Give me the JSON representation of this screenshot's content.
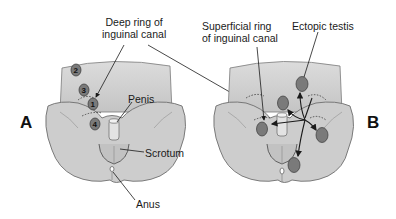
{
  "panels": {
    "a": {
      "letter": "A",
      "labels": {
        "deep_ring": [
          "Deep ring of",
          "inguinal canal"
        ],
        "penis": "Penis",
        "scrotum": "Scrotum",
        "anus": "Anus"
      },
      "positions": [
        "1",
        "2",
        "3",
        "4"
      ]
    },
    "b": {
      "letter": "B",
      "labels": {
        "superficial_ring": [
          "Superficial ring",
          "of inguinal canal"
        ],
        "ectopic_testis": "Ectopic testis"
      }
    }
  },
  "colors": {
    "body_fill": "#c9c9c9",
    "body_stroke": "#6e6e6e",
    "testis_fill": "#7a7a7a",
    "testis_stroke": "#3a3a3a",
    "line": "#1a1a1a"
  }
}
